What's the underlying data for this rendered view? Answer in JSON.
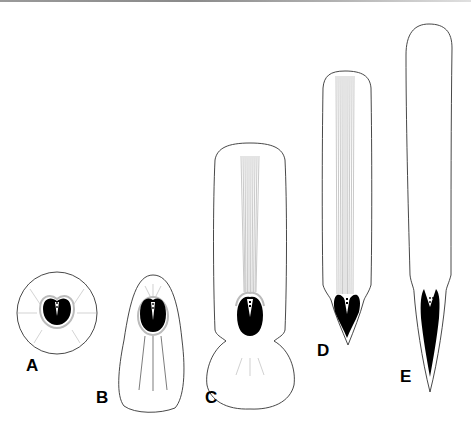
{
  "figure": {
    "panels": [
      {
        "id": "A",
        "label": "A",
        "description": "circular stage, dark body with halo and radial lines"
      },
      {
        "id": "B",
        "label": "B",
        "description": "bell-shaped stage with three longitudinal lines"
      },
      {
        "id": "C",
        "label": "C",
        "description": "elongated stage with fibre bundle and basal bulb"
      },
      {
        "id": "D",
        "label": "D",
        "description": "long stage with fibre bundle and pointed V-shaped base"
      },
      {
        "id": "E",
        "label": "E",
        "description": "longest stage, tapering with pointed V-shaped base"
      }
    ],
    "colors": {
      "outline": "#333333",
      "fill": "#000000",
      "fibre": "#9a9a9a",
      "halo": "#bdbdbd",
      "background": "#ffffff"
    }
  }
}
